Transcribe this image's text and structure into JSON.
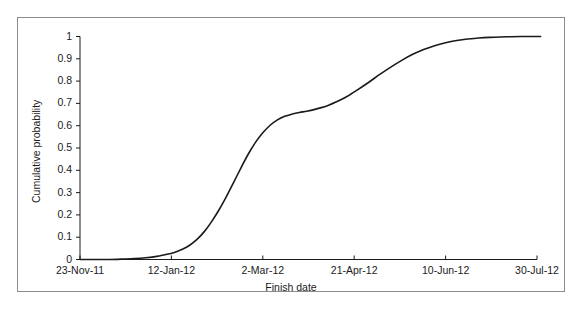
{
  "chart_data": {
    "type": "line",
    "title": "",
    "xlabel": "Finish date",
    "ylabel": "Cumulative probability",
    "grid": false,
    "legend": null,
    "line_color": "#1a1a1a",
    "frame_color": "#8c8c8c",
    "xticklabels": [
      "23-Nov-11",
      "12-Jan-12",
      "2-Mar-12",
      "21-Apr-12",
      "10-Jun-12",
      "30-Jul-12"
    ],
    "yticklabels": [
      "0",
      "0.1",
      "0.2",
      "0.3",
      "0.4",
      "0.5",
      "0.6",
      "0.7",
      "0.8",
      "0.9",
      "1"
    ],
    "ylim": [
      0,
      1
    ],
    "xlim": [
      "23-Nov-11",
      "30-Jul-12"
    ],
    "x_tick_days": [
      0,
      50,
      100,
      150,
      200,
      250
    ],
    "series": [
      {
        "name": "Cumulative probability",
        "x_days": [
          0,
          8,
          16,
          24,
          30,
          36,
          42,
          47,
          52,
          56,
          60,
          64,
          68,
          72,
          76,
          80,
          84,
          88,
          92,
          96,
          100,
          104,
          108,
          112,
          116,
          120,
          124,
          128,
          132,
          136,
          140,
          146,
          152,
          158,
          164,
          170,
          176,
          182,
          188,
          194,
          200,
          206,
          212,
          218,
          224,
          230,
          236,
          242,
          248,
          252
        ],
        "values": [
          0.0,
          0.0,
          0.0,
          0.002,
          0.004,
          0.008,
          0.014,
          0.022,
          0.033,
          0.046,
          0.064,
          0.09,
          0.125,
          0.17,
          0.222,
          0.281,
          0.345,
          0.41,
          0.472,
          0.525,
          0.568,
          0.602,
          0.626,
          0.642,
          0.652,
          0.659,
          0.665,
          0.672,
          0.681,
          0.692,
          0.706,
          0.731,
          0.762,
          0.795,
          0.83,
          0.863,
          0.893,
          0.92,
          0.942,
          0.959,
          0.972,
          0.982,
          0.989,
          0.993,
          0.996,
          0.998,
          0.999,
          1.0,
          1.0,
          1.0
        ]
      }
    ]
  },
  "axes": {
    "y_title": "Cumulative probability",
    "x_title": "Finish date"
  }
}
